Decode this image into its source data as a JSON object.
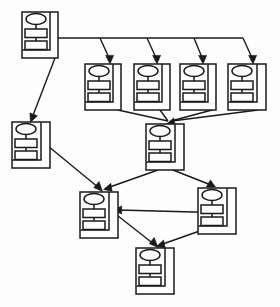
{
  "diagram": {
    "title": "",
    "type": "node-graph",
    "background_color": "#fdfdfd",
    "line_color": "#1a1a1a",
    "node_fill_color": "#fdfdfd",
    "node_glyph": {
      "name": "object-node-icon",
      "description": "ellipse over two stacked rectangles inside an open box with back panel",
      "ellipse_label": "",
      "rect_top_label": "",
      "rect_bottom_label": ""
    },
    "nodes": [
      {
        "id": "n1",
        "name": "node-root",
        "label": "",
        "x": 22,
        "y": 12,
        "w": 36,
        "h": 46
      },
      {
        "id": "n2",
        "name": "node-branch-1",
        "label": "",
        "x": 85,
        "y": 64,
        "w": 36,
        "h": 46
      },
      {
        "id": "n3",
        "name": "node-branch-2",
        "label": "",
        "x": 134,
        "y": 64,
        "w": 36,
        "h": 46
      },
      {
        "id": "n4",
        "name": "node-branch-3",
        "label": "",
        "x": 180,
        "y": 64,
        "w": 36,
        "h": 46
      },
      {
        "id": "n5",
        "name": "node-branch-4",
        "label": "",
        "x": 228,
        "y": 64,
        "w": 36,
        "h": 46
      },
      {
        "id": "n6",
        "name": "node-left-middle",
        "label": "",
        "x": 12,
        "y": 122,
        "w": 36,
        "h": 46
      },
      {
        "id": "n7",
        "name": "node-center-middle",
        "label": "",
        "x": 146,
        "y": 124,
        "w": 36,
        "h": 46
      },
      {
        "id": "n8",
        "name": "node-left-lower",
        "label": "",
        "x": 80,
        "y": 192,
        "w": 36,
        "h": 46
      },
      {
        "id": "n9",
        "name": "node-right-lower",
        "label": "",
        "x": 198,
        "y": 188,
        "w": 36,
        "h": 46
      },
      {
        "id": "n10",
        "name": "node-bottom",
        "label": "",
        "x": 136,
        "y": 248,
        "w": 36,
        "h": 46
      }
    ],
    "edges": [
      {
        "name": "edge-root-to-branch-1",
        "from": "n1",
        "to": "n2",
        "arrow": true
      },
      {
        "name": "edge-root-to-branch-2",
        "from": "n1",
        "to": "n3",
        "arrow": true
      },
      {
        "name": "edge-root-to-branch-3",
        "from": "n1",
        "to": "n4",
        "arrow": true
      },
      {
        "name": "edge-root-to-branch-4",
        "from": "n1",
        "to": "n5",
        "arrow": true
      },
      {
        "name": "edge-root-to-left-middle",
        "from": "n1",
        "to": "n6",
        "arrow": true
      },
      {
        "name": "edge-branch-1-to-center",
        "from": "n2",
        "to": "n7",
        "arrow": true
      },
      {
        "name": "edge-branch-2-to-center",
        "from": "n3",
        "to": "n7",
        "arrow": true
      },
      {
        "name": "edge-branch-3-to-center",
        "from": "n4",
        "to": "n7",
        "arrow": true
      },
      {
        "name": "edge-branch-4-to-center",
        "from": "n5",
        "to": "n7",
        "arrow": true
      },
      {
        "name": "edge-left-middle-to-left-lower",
        "from": "n6",
        "to": "n8",
        "arrow": true
      },
      {
        "name": "edge-center-to-left-lower",
        "from": "n7",
        "to": "n8",
        "arrow": true
      },
      {
        "name": "edge-center-to-right-lower",
        "from": "n7",
        "to": "n9",
        "arrow": true
      },
      {
        "name": "edge-right-lower-to-left-lower",
        "from": "n9",
        "to": "n8",
        "arrow": true
      },
      {
        "name": "edge-left-lower-to-bottom",
        "from": "n8",
        "to": "n10",
        "arrow": true
      },
      {
        "name": "edge-right-lower-to-bottom",
        "from": "n9",
        "to": "n10",
        "arrow": true
      }
    ]
  }
}
